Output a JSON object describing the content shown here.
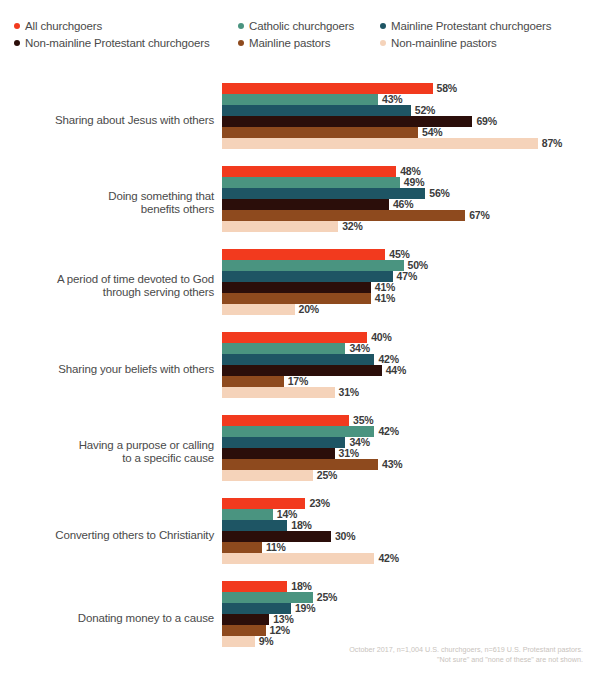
{
  "legend": {
    "rows": [
      [
        {
          "label": "All churchgoers",
          "color": "#F23A1E",
          "dot": "legend-dot-all-churchgoers"
        },
        {
          "label": "Catholic churchgoers",
          "color": "#4A9480",
          "dot": "legend-dot-catholic-churchgoers"
        },
        {
          "label": "Mainline Protestant churchgoers",
          "color": "#1E5564",
          "dot": "legend-dot-mainline-protestant-churchgoers"
        }
      ],
      [
        {
          "label": "Non-mainline Protestant churchgoers",
          "color": "#2B0E0A",
          "dot": "legend-dot-non-mainline-protestant-churchgoers"
        },
        {
          "label": "Mainline pastors",
          "color": "#8E4A1E",
          "dot": "legend-dot-mainline-pastors"
        },
        {
          "label": "Non-mainline pastors",
          "color": "#F5D3BA",
          "dot": "legend-dot-non-mainline-pastors"
        }
      ]
    ]
  },
  "footnote": {
    "line1": "October 2017, n=1,004 U.S. churchgoers, n=619 U.S. Protestant pastors.",
    "line2": "\"Not sure\" and \"none of these\" are not shown."
  },
  "chart_data": {
    "type": "bar",
    "orientation": "horizontal",
    "title": "",
    "subtitle": "",
    "xlabel": "",
    "ylabel": "",
    "xlim": [
      0,
      100
    ],
    "grid": false,
    "legend_position": "top",
    "value_suffix": "%",
    "px_per_unit": 3.63,
    "categories": [
      "Sharing about Jesus with others",
      "Doing something that benefits others",
      "A period of time devoted to God through serving others",
      "Sharing your beliefs with others",
      "Having a purpose or calling to a specific cause",
      "Converting others to Christianity",
      "Donating money to a cause"
    ],
    "category_lines": [
      [
        "Sharing about Jesus with others"
      ],
      [
        "Doing something that",
        "benefits others"
      ],
      [
        "A period of time devoted to God",
        "through serving others"
      ],
      [
        "Sharing your beliefs with others"
      ],
      [
        "Having a purpose or calling",
        "to a specific cause"
      ],
      [
        "Converting others to Christianity"
      ],
      [
        "Donating money to a cause"
      ]
    ],
    "series": [
      {
        "name": "All churchgoers",
        "color": "#F23A1E",
        "values": [
          58,
          48,
          45,
          40,
          35,
          23,
          18
        ]
      },
      {
        "name": "Catholic churchgoers",
        "color": "#4A9480",
        "values": [
          43,
          49,
          50,
          34,
          42,
          14,
          25
        ]
      },
      {
        "name": "Mainline Protestant churchgoers",
        "color": "#1E5564",
        "values": [
          52,
          56,
          47,
          42,
          34,
          18,
          19
        ]
      },
      {
        "name": "Non-mainline Protestant churchgoers",
        "color": "#2B0E0A",
        "values": [
          69,
          46,
          41,
          44,
          31,
          30,
          13
        ]
      },
      {
        "name": "Mainline pastors",
        "color": "#8E4A1E",
        "values": [
          54,
          67,
          41,
          17,
          43,
          11,
          12
        ]
      },
      {
        "name": "Non-mainline pastors",
        "color": "#F5D3BA",
        "values": [
          87,
          32,
          20,
          31,
          25,
          42,
          9
        ]
      }
    ],
    "labels": [
      [
        "58%",
        "43%",
        "52%",
        "69%",
        "54%",
        "87%"
      ],
      [
        "48%",
        "49%",
        "56%",
        "46%",
        "67%",
        "32%"
      ],
      [
        "45%",
        "50%",
        "47%",
        "41%",
        "41%",
        "20%"
      ],
      [
        "40%",
        "34%",
        "42%",
        "44%",
        "17%",
        "31%"
      ],
      [
        "35%",
        "42%",
        "34%",
        "31%",
        "43%",
        "25%"
      ],
      [
        "23%",
        "14%",
        "18%",
        "30%",
        "11%",
        "42%"
      ],
      [
        "18%",
        "25%",
        "19%",
        "13%",
        "12%",
        "9%"
      ]
    ]
  }
}
